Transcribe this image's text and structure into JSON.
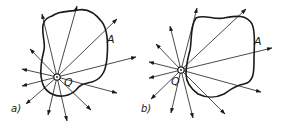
{
  "figure": {
    "panels": [
      {
        "id": "a",
        "caption": "a)",
        "point_label": "Q",
        "surface_point_label": "A",
        "description": "Point charge Q inside a closed surface; all field lines pass out through the surface"
      },
      {
        "id": "b",
        "caption": "b)",
        "point_label": "Q",
        "surface_point_label": "A",
        "description": "Point charge Q outside a closed surface; field lines entering the surface also leave it"
      }
    ]
  }
}
